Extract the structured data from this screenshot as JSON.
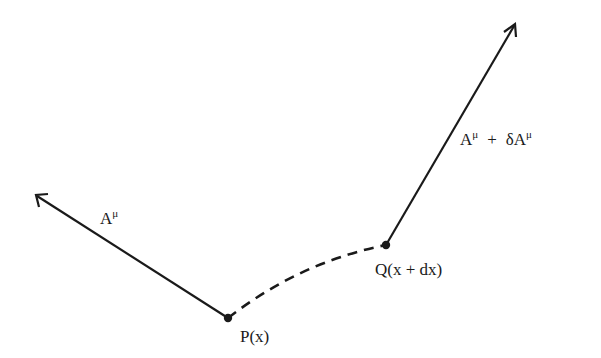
{
  "diagram": {
    "type": "parallel-transport-vector-diagram",
    "points": {
      "P": {
        "label": "P(x)",
        "x": 228,
        "y": 318
      },
      "Q": {
        "label": "Q(x + dx)",
        "x": 386,
        "y": 245
      }
    },
    "vectors": {
      "at_P": {
        "base": "A",
        "superscript": "μ",
        "tip": {
          "x": 36,
          "y": 195
        }
      },
      "at_Q": {
        "base1": "A",
        "sup1": "μ",
        "plus": "+",
        "base2": "δA",
        "sup2": "μ",
        "tip": {
          "x": 515,
          "y": 24
        }
      }
    },
    "path": {
      "style": "dashed",
      "from": "P",
      "to": "Q"
    },
    "colors": {
      "ink": "#1a1a1a",
      "background": "#ffffff"
    }
  }
}
